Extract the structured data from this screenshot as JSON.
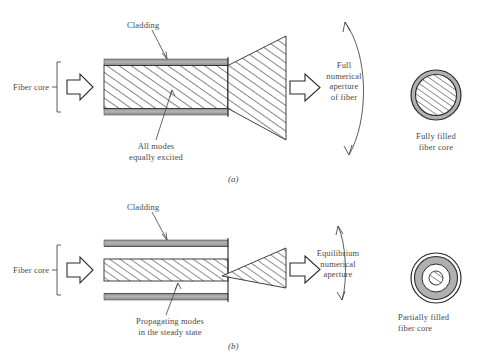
{
  "figure": {
    "panels": [
      {
        "id": "a",
        "caption": "(a)",
        "cladding_label": "Cladding",
        "fiber_core_label": "Fiber core",
        "modes_label": "All modes\nequally excited",
        "aperture_label": "Full\nnumerical\naperture\nof fiber",
        "cross_section_label": "Fully filled\nfiber core"
      },
      {
        "id": "b",
        "caption": "(b)",
        "cladding_label": "Cladding",
        "fiber_core_label": "Fiber core",
        "modes_label": "Propagating modes\nin the steady state",
        "aperture_label": "Equilibrium\nnumerical\naperture",
        "cross_section_label": "Partially filled\nfiber core"
      }
    ]
  },
  "colors": {
    "cladding_gray": "#9a9a9a",
    "line": "#2b2b2b",
    "text": "#4a4a4a",
    "hatch": "#2b2b2b",
    "background": "#ffffff"
  }
}
